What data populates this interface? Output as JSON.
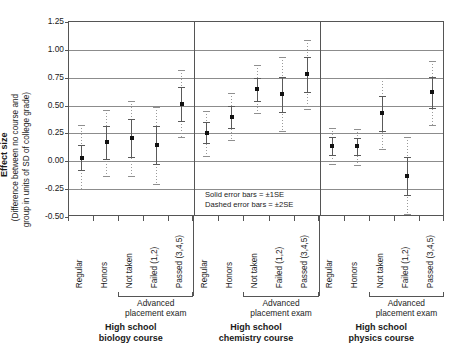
{
  "axis": {
    "y_title_bold": "Effect size",
    "y_title_line1": "(Difference between no course and",
    "y_title_line2": "group in units of SD of college grade)",
    "ticks": [
      "1.25",
      "1.00",
      "0.75",
      "0.50",
      "0.25",
      "0.00",
      "-0.25",
      "-0.50"
    ]
  },
  "legend": {
    "line1": "Solid error bars = ±1SE",
    "line2": "Dashed error bars = ±2SE"
  },
  "groups": [
    {
      "name": "High school",
      "name2": "biology course",
      "ap_label1": "Advanced",
      "ap_label2": "placement exam"
    },
    {
      "name": "High school",
      "name2": "chemistry course",
      "ap_label1": "Advanced",
      "ap_label2": "placement exam"
    },
    {
      "name": "High school",
      "name2": "physics course",
      "ap_label1": "Advanced",
      "ap_label2": "placement exam"
    }
  ],
  "chart_data": {
    "type": "scatter",
    "title": "",
    "xlabel": "",
    "ylabel": "Effect size (Difference between no course and group in units of SD of college grade)",
    "ylim": [
      -0.5,
      1.25
    ],
    "yticks": [
      -0.5,
      -0.25,
      0.0,
      0.25,
      0.5,
      0.75,
      1.0,
      1.25
    ],
    "grid": true,
    "legend_position": "inside-center",
    "error_bar_note": "Solid error bars = ±1SE; Dashed error bars = ±2SE",
    "panels": [
      {
        "panel": "High school biology course",
        "categories": [
          "Regular",
          "Honors",
          "Not taken",
          "Failed (1,2)",
          "Passed (3,4,5)"
        ],
        "ap_categories": [
          "Not taken",
          "Failed (1,2)",
          "Passed (3,4,5)"
        ],
        "points": [
          {
            "category": "Regular",
            "value": 0.03,
            "se1_low": -0.08,
            "se1_high": 0.15,
            "se2_low": -0.25,
            "se2_high": 0.33
          },
          {
            "category": "Honors",
            "value": 0.17,
            "se1_low": 0.02,
            "se1_high": 0.32,
            "se2_low": -0.13,
            "se2_high": 0.46
          },
          {
            "category": "Not taken",
            "value": 0.21,
            "se1_low": 0.04,
            "se1_high": 0.38,
            "se2_low": -0.13,
            "se2_high": 0.54
          },
          {
            "category": "Failed (1,2)",
            "value": 0.15,
            "se1_low": -0.02,
            "se1_high": 0.32,
            "se2_low": -0.2,
            "se2_high": 0.49
          },
          {
            "category": "Passed (3,4,5)",
            "value": 0.51,
            "se1_low": 0.36,
            "se1_high": 0.67,
            "se2_low": 0.22,
            "se2_high": 0.82
          }
        ]
      },
      {
        "panel": "High school chemistry course",
        "categories": [
          "Regular",
          "Honors",
          "Not taken",
          "Failed (1,2)",
          "Passed (3,4,5)"
        ],
        "ap_categories": [
          "Not taken",
          "Failed (1,2)",
          "Passed (3,4,5)"
        ],
        "points": [
          {
            "category": "Regular",
            "value": 0.25,
            "se1_low": 0.16,
            "se1_high": 0.35,
            "se2_low": 0.05,
            "se2_high": 0.45
          },
          {
            "category": "Honors",
            "value": 0.4,
            "se1_low": 0.3,
            "se1_high": 0.5,
            "se2_low": 0.19,
            "se2_high": 0.61
          },
          {
            "category": "Not taken",
            "value": 0.65,
            "se1_low": 0.54,
            "se1_high": 0.75,
            "se2_low": 0.43,
            "se2_high": 0.86
          },
          {
            "category": "Failed (1,2)",
            "value": 0.6,
            "se1_low": 0.44,
            "se1_high": 0.76,
            "se2_low": 0.27,
            "se2_high": 0.94
          },
          {
            "category": "Passed (3,4,5)",
            "value": 0.78,
            "se1_low": 0.62,
            "se1_high": 0.94,
            "se2_low": 0.47,
            "se2_high": 1.09
          }
        ]
      },
      {
        "panel": "High school physics course",
        "categories": [
          "Regular",
          "Honors",
          "Not taken",
          "Failed (1,2)",
          "Passed (3,4,5)"
        ],
        "ap_categories": [
          "Not taken",
          "Failed (1,2)",
          "Passed (3,4,5)"
        ],
        "points": [
          {
            "category": "Regular",
            "value": 0.14,
            "se1_low": 0.06,
            "se1_high": 0.22,
            "se2_low": -0.02,
            "se2_high": 0.3
          },
          {
            "category": "Honors",
            "value": 0.14,
            "se1_low": 0.06,
            "se1_high": 0.21,
            "se2_low": -0.03,
            "se2_high": 0.29
          },
          {
            "category": "Not taken",
            "value": 0.43,
            "se1_low": 0.27,
            "se1_high": 0.59,
            "se2_low": 0.11,
            "se2_high": 0.75
          },
          {
            "category": "Failed (1,2)",
            "value": -0.13,
            "se1_low": -0.3,
            "se1_high": 0.04,
            "se2_low": -0.47,
            "se2_high": 0.22
          },
          {
            "category": "Passed (3,4,5)",
            "value": 0.62,
            "se1_low": 0.48,
            "se1_high": 0.76,
            "se2_low": 0.33,
            "se2_high": 0.9
          }
        ]
      }
    ]
  }
}
